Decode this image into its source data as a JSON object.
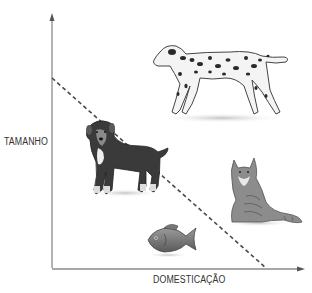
{
  "diagram": {
    "y_axis": {
      "label": "TAMANHO"
    },
    "x_axis": {
      "label": "DOMESTICAÇÃO"
    },
    "trend_line": {
      "style": "dashed",
      "direction": "decreasing",
      "from": "high size / low domestication",
      "to": "low size / high domestication"
    },
    "animals": [
      {
        "name": "dalmatian",
        "label": "Dálmata",
        "position": "top-right, above line"
      },
      {
        "name": "mixed-breed-dog",
        "label": "Cão",
        "position": "middle-left, on line"
      },
      {
        "name": "cat",
        "label": "Gato",
        "position": "middle-right, below line"
      },
      {
        "name": "fish",
        "label": "Peixe",
        "position": "bottom-center, below line"
      }
    ],
    "colors": {
      "axis": "#8a8a8a",
      "dashed_line": "#4a4a4a",
      "text": "#333333",
      "background": "#ffffff"
    }
  }
}
